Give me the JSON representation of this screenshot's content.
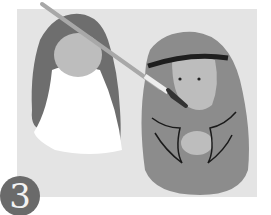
{
  "illustration": {
    "description": "Step 3: painting two rock figures (a bride with veil and a man with headdress)",
    "step_number": "3",
    "colors": {
      "background": "#e4e4e4",
      "veil": "#6e6e6e",
      "face": "#bdbdbd",
      "dress": "#ffffff",
      "robe": "#8c8c8c",
      "headband": "#1e1e1e",
      "brush_handle": "#a8a8a8"
    }
  }
}
